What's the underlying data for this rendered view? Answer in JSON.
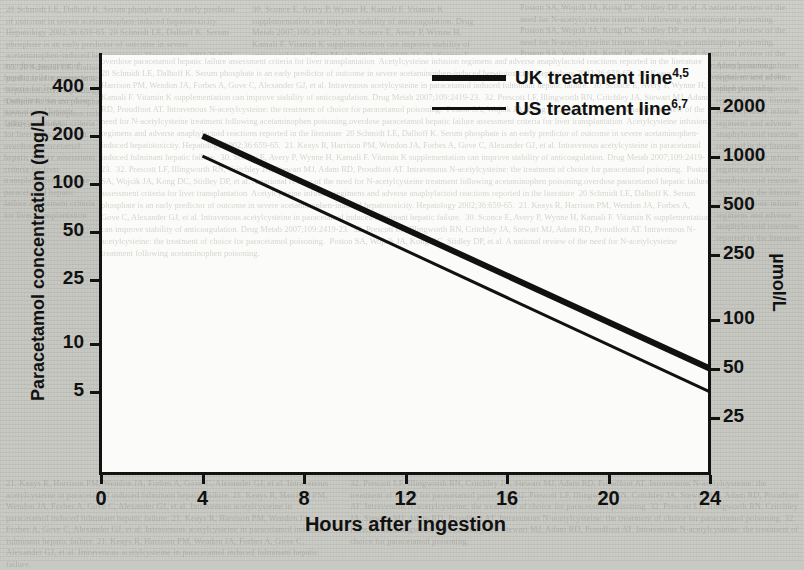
{
  "page": {
    "background_hex": "#c9c9c4",
    "plot_background_hex": "#fbfbf9",
    "ink_hex": "#111111",
    "ghost_text": {
      "top_left": "20 Schmidt LE, Dalhoff K. Serum phosphate is an early predictor of outcome in severe acetaminophen-induced hepatotoxicity. Hepatology 2002;36:659-65.",
      "top_middle": "30. Sconce E, Avery P, Wynne H, Kamali F. Vitamin K supplementation can improve stability of anticoagulation. Drug Metab 2007;109:2419-23.",
      "top_right": "Poston SA, Wojcik JA, Kong DC, Stidley DP, et al. A national review of the need for N-acetylcysteine treatment following acetaminophen poisoning.",
      "mid_left": "overdose paracetamol hepatic failure assessment criteria for liver transplantation",
      "mid_right": "Acetylcysteine infusion regimens and adverse anaphylactoid reactions reported in the literature",
      "bottom_left": "21. Keays R, Harrison PM, Wendon JA, Forbes A, Gove C, Alexander GJ, et al. Intravenous acetylcysteine in paracetamol induced fulminant hepatic failure.",
      "bottom_right": "32. Prescott LF, Illingworth RN, Critchley JA, Stewart MJ, Adam RD, Proudfoot AT. Intravenous N-acetylcysteine: the treatment of choice for paracetamol poisoning."
    }
  },
  "chart_data": {
    "type": "line",
    "title": "",
    "xlabel": "Hours after ingestion",
    "ylabel": "Paracetamol concentration (mg/L)",
    "ylabel_right": "µmol/L",
    "xlim": [
      0,
      24
    ],
    "ylim_mgL": [
      4,
      500
    ],
    "y_scale": "log",
    "grid": false,
    "legend_position": "top-right inside plot",
    "xticks": [
      "0",
      "4",
      "8",
      "12",
      "16",
      "20",
      "24"
    ],
    "xtick_values": [
      0,
      4,
      8,
      12,
      16,
      20,
      24
    ],
    "yticks_left": [
      "400",
      "200",
      "100",
      "50",
      "25",
      "10",
      "5"
    ],
    "ytick_values_left": [
      400,
      200,
      100,
      50,
      25,
      10,
      5
    ],
    "yticks_right": [
      "2000",
      "1000",
      "500",
      "250",
      "100",
      "50",
      "25"
    ],
    "ytick_values_right": [
      2000,
      1000,
      500,
      250,
      100,
      50,
      25
    ],
    "series": [
      {
        "name": "UK treatment line",
        "superscript": "4,5",
        "line_width_px": 6,
        "color": "#111111",
        "x": [
          4,
          24
        ],
        "values": [
          200,
          7.0
        ],
        "units": "mg/L"
      },
      {
        "name": "US treatment line",
        "superscript": "6,7",
        "line_width_px": 3,
        "color": "#111111",
        "x": [
          4,
          24
        ],
        "values": [
          150,
          5.0
        ],
        "units": "mg/L"
      }
    ]
  },
  "legend": {
    "items": [
      {
        "label": "UK treatment line",
        "sup": "4,5"
      },
      {
        "label": "US treatment line",
        "sup": "6,7"
      }
    ]
  }
}
